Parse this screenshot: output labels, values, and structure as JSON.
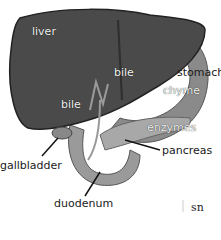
{
  "diagram": {
    "type": "anatomical illustration",
    "labels": {
      "liver": "liver",
      "bile_upper": "bile",
      "bile_lower": "bile",
      "stomach": "stomach",
      "chyme": "chyme",
      "enzymes": "enzymes",
      "pancreas": "pancreas",
      "gallbladder": "gallbladder",
      "duodenum": "duodenum"
    },
    "corner_text": "sn",
    "colors": {
      "liver": "#4a4a4a",
      "liver_dark": "#2e2e2e",
      "stomach": "#8a8a8a",
      "duct": "#9a9a9a",
      "label_dark": "#1a1a1a",
      "label_light": "#f2f2f2"
    }
  }
}
